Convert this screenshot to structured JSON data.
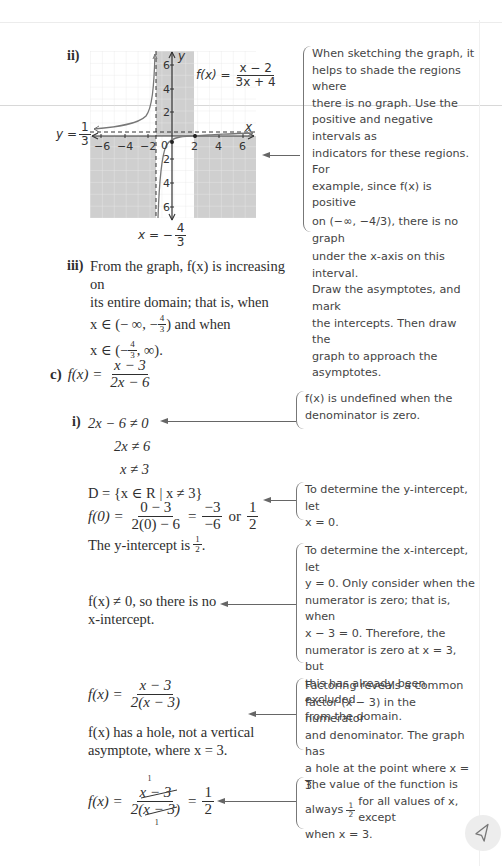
{
  "graph": {
    "label": "ii)",
    "function_label": "f(x) =",
    "function_num": "x − 2",
    "function_den": "3x + 4",
    "h_asymptote_label_prefix": "y =",
    "h_asymptote_num": "1",
    "h_asymptote_den": "3",
    "v_asymptote_label_prefix": "x = −",
    "v_asymptote_num": "4",
    "v_asymptote_den": "3",
    "x_axis_label": "x",
    "y_axis_label": "y",
    "x_ticks": [
      "−6",
      "−4",
      "−2",
      "0",
      "2",
      "4",
      "6"
    ],
    "y_ticks_pos": [
      "2",
      "4",
      "6"
    ],
    "y_ticks_neg": [
      "2",
      "4",
      "6"
    ]
  },
  "notes": {
    "sketch": {
      "lines": [
        "When sketching the graph, it",
        "helps to shade the regions where",
        "there is no graph. Use the",
        "positive and negative intervals as",
        "indicators for these regions. For",
        "example, since f(x) is positive",
        "on (−∞, −4/3), there is no graph",
        "under the x-axis on this interval.",
        "Draw the asymptotes, and mark",
        "the intercepts. Then draw the",
        "graph to approach the",
        "asymptotes."
      ]
    },
    "undefined": {
      "lines": [
        "f(x) is undefined when the",
        "denominator is zero."
      ]
    },
    "y_intercept": {
      "lines": [
        "To determine the y-intercept, let",
        "x = 0."
      ]
    },
    "x_intercept": {
      "lines": [
        "To determine the x-intercept, let",
        "y = 0. Only consider when the",
        "numerator is zero; that is, when",
        "x − 3 = 0. Therefore, the",
        "numerator is zero at x = 3, but",
        "this has already been excluded",
        "from the domain."
      ]
    },
    "factoring": {
      "lines": [
        "Factoring reveals a common",
        "factor (x − 3) in the numerator",
        "and denominator. The graph has",
        "a hole at the point where x = 3."
      ]
    },
    "value": {
      "line1_prefix": "The value of the function is",
      "line2_prefix": "always",
      "line2_num": "1",
      "line2_den": "2",
      "line2_suffix": "for all values of x, except",
      "line3": "when x = 3."
    }
  },
  "part_iii": {
    "label": "iii)",
    "line1": "From the graph, f(x) is increasing on",
    "line2": "its entire domain; that is, when",
    "line3_prefix": "x ∈ (− ∞, −",
    "line3_num": "4",
    "line3_den": "3",
    "line3_suffix": ") and when",
    "line4_prefix": "x ∈ (−",
    "line4_num": "4",
    "line4_den": "3",
    "line4_suffix": ", ∞)."
  },
  "part_c": {
    "label": "c)",
    "f_lhs": "f(x) =",
    "f_num": "x − 3",
    "f_den": "2x − 6",
    "i_label": "i)",
    "step1": "2x − 6 ≠ 0",
    "step2": "2x ≠ 6",
    "step3": "x ≠ 3",
    "domain": "D = {x ∈ R | x ≠ 3}",
    "f0_lhs": "f(0) =",
    "f0_num1": "0 − 3",
    "f0_den1": "2(0) − 6",
    "f0_eq": "=",
    "f0_num2": "−3",
    "f0_den2": "−6",
    "f0_or": "or",
    "f0_num3": "1",
    "f0_den3": "2",
    "y_int_prefix": "The y-intercept is",
    "y_int_num": "1",
    "y_int_den": "2",
    "no_x_int_line1": "f(x) ≠ 0, so there is no",
    "no_x_int_line2": "x-intercept.",
    "factored_lhs": "f(x) =",
    "factored_num": "x − 3",
    "factored_den": "2(x − 3)",
    "hole_line1": "f(x) has a hole, not a vertical",
    "hole_line2": "asymptote, where x = 3.",
    "cancel_lhs": "f(x) =",
    "cancel_num": "x − 3",
    "cancel_den": "2(x − 3)",
    "cancel_mark": "1",
    "cancel_eq": "=",
    "cancel_res_num": "1",
    "cancel_res_den": "2"
  },
  "ui": {
    "cursor_button_icon": "cursor-arrow-icon"
  }
}
